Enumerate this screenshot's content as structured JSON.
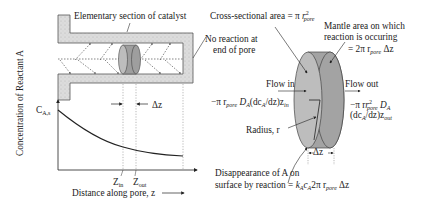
{
  "diagram": {
    "labels": {
      "elementary_section": "Elementary section of catalyst",
      "no_reaction": [
        "No reaction at",
        "end of pore"
      ],
      "cross_sectional_area": "Cross-sectional area = π r²pore",
      "cross_sectional_prefix": "Cross-sectional area = π ",
      "mantle_area_lines": [
        "Mantle area on which",
        "reaction is occuring"
      ],
      "mantle_area_eq": "= 2π r",
      "mantle_area_eq_tail": " Δz",
      "flow_in": "Flow in",
      "flow_out": "Flow out",
      "flow_in_eq_a": "−π r",
      "flow_in_eq_b": " D",
      "flow_in_eq_c": "(dc",
      "flow_in_eq_d": "/dz)z",
      "flow_out_eq_a": "−π r",
      "flow_out_eq_b": " D",
      "flow_out_eq_c": "(dc",
      "flow_out_eq_d": "/dz)z",
      "radius": "Radius, r",
      "delta_z": "Δz",
      "disappearance_lines": [
        "Disappearance of A on",
        "surface by reaction = "
      ],
      "disappearance_eq_a": "k",
      "disappearance_eq_b": "c",
      "disappearance_eq_c": "2π r",
      "disappearance_eq_d": " Δz",
      "sub_pore": "pore",
      "sub_A": "A",
      "sub_in": "in",
      "sub_out": "out",
      "sup_2": "2"
    },
    "plot": {
      "ylabel": "Concentration of Reactant A",
      "xlabel": "Distance along pore, z",
      "y_start_label": "C",
      "y_start_sub": "A,s",
      "z_in": "Z",
      "z_in_sub": "in",
      "z_out": "Z",
      "z_out_sub": "out",
      "delta_z": "Δz"
    },
    "colors": {
      "catalyst_fill": "#d9d9d9",
      "cylinder_face": "#b3b3b3",
      "cylinder_body": "#a6a6a6",
      "line": "#222222",
      "dotted": "#888888"
    }
  }
}
